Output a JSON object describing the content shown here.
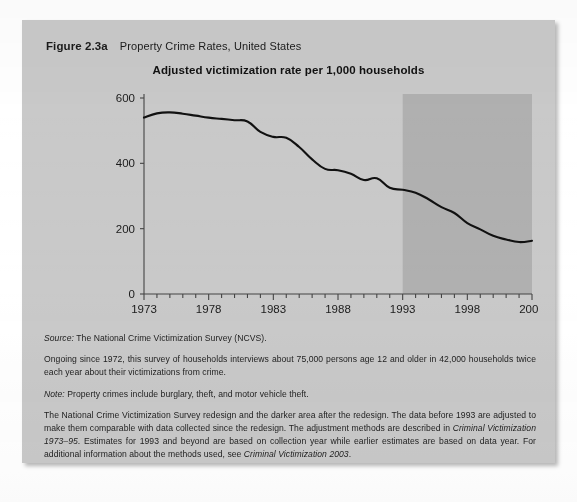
{
  "figure": {
    "number": "Figure 2.3a",
    "caption": "Property Crime Rates, United States"
  },
  "colors": {
    "card_background": "#c9c9c9",
    "plot_background": "#c9c9c9",
    "shaded_region": "#b0b0b0",
    "line": "#111111",
    "axis": "#444444",
    "text": "#1b1b1b"
  },
  "chart_data": {
    "type": "line",
    "title": "Adjusted victimization rate per 1,000 households",
    "xlabel": "",
    "ylabel": "",
    "xlim": [
      1973,
      2003
    ],
    "ylim": [
      0,
      600
    ],
    "yticks": [
      0,
      200,
      400,
      600
    ],
    "ytick_labels": [
      "0",
      "200",
      "400",
      "600"
    ],
    "xticks": [
      1973,
      1978,
      1983,
      1988,
      1993,
      1998,
      2003
    ],
    "xtick_labels": [
      "1973",
      "1978",
      "1983",
      "1988",
      "1993",
      "1998",
      "2003"
    ],
    "minor_xtick_interval": 1,
    "grid": false,
    "legend": null,
    "shaded_region": {
      "label": "post-redesign",
      "x_start": 1993,
      "x_end": 2003
    },
    "x": [
      1973,
      1974,
      1975,
      1976,
      1977,
      1978,
      1979,
      1980,
      1981,
      1982,
      1983,
      1984,
      1985,
      1986,
      1987,
      1988,
      1989,
      1990,
      1991,
      1992,
      1993,
      1994,
      1995,
      1996,
      1997,
      1998,
      1999,
      2000,
      2001,
      2002,
      2003
    ],
    "values": [
      540,
      553,
      556,
      552,
      546,
      540,
      536,
      532,
      528,
      496,
      481,
      478,
      450,
      412,
      383,
      379,
      368,
      349,
      354,
      325,
      319,
      310,
      290,
      266,
      248,
      217,
      198,
      178,
      167,
      159,
      163
    ],
    "series": [
      {
        "name": "Adjusted victimization rate per 1,000 households",
        "values": [
          540,
          553,
          556,
          552,
          546,
          540,
          536,
          532,
          528,
          496,
          481,
          478,
          450,
          412,
          383,
          379,
          368,
          349,
          354,
          325,
          319,
          310,
          290,
          266,
          248,
          217,
          198,
          178,
          167,
          159,
          163
        ]
      }
    ]
  },
  "notes": {
    "source_label": "Source:",
    "source_text": " The National Crime Victimization Survey (NCVS).",
    "ongoing": "Ongoing since 1972, this survey of households interviews about 75,000 persons age 12 and older in 42,000 households twice each year about their victimizations from crime.",
    "note_label": "Note:",
    "note_text": " Property crimes include burglary, theft, and motor vehicle theft.",
    "redesign_part1": "The National Crime Victimization Survey redesign and the darker area after the redesign. The data before 1993 are adjusted to make them comparable with data collected since the redesign. The adjustment methods are described in ",
    "redesign_italic1": "Criminal Victimization 1973–95",
    "redesign_part2": ". Estimates for 1993 and beyond are based on collection year while earlier estimates are based on data year. For additional information about the methods used, see ",
    "redesign_italic2": "Criminal Victimization  2003",
    "redesign_part3": "."
  }
}
